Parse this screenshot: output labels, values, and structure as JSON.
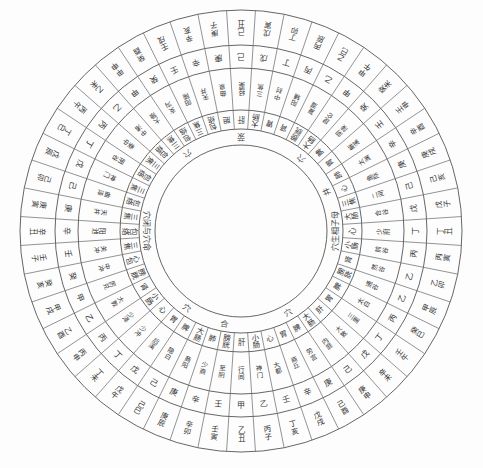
{
  "diagram": {
    "center": {
      "x": 241,
      "y": 231
    },
    "radii": {
      "outer": 221,
      "r1": 186,
      "r2": 163,
      "r3": 121,
      "inner": 86
    },
    "line_color": "#555555",
    "inner_labels": [
      {
        "text": "穴闭与穴命",
        "angle": 270
      },
      {
        "text": "穴生相子母",
        "angle": 90
      },
      {
        "text": "穴",
        "angle": 215
      },
      {
        "text": "荥",
        "angle": 180
      },
      {
        "text": "穴",
        "angle": 140
      },
      {
        "text": "井",
        "angle": 115
      },
      {
        "text": "合",
        "angle": 350
      },
      {
        "text": "穴",
        "angle": 325
      },
      {
        "text": "穴",
        "angle": 30
      }
    ],
    "outer_ring_ganzhi": [
      "乙丑",
      "壬寅",
      "辛卯",
      "庚辰",
      "己巳",
      "戊午",
      "丁未",
      "丙申",
      "乙酉",
      "甲戌",
      "癸亥",
      "壬子",
      "辛丑",
      "庚寅",
      "己卯",
      "戊辰",
      "丁巳",
      "丙午",
      "乙未",
      "甲申",
      "癸酉",
      "壬戌",
      "辛亥",
      "庚子",
      "己丑",
      "戊寅",
      "丁卯",
      "丙辰",
      "乙巳",
      "甲午",
      "癸未",
      "壬申",
      "辛酉",
      "庚戌",
      "己亥",
      "戊子",
      "丁丑",
      "丙寅",
      "乙卯",
      "甲辰",
      "癸巳",
      "壬午",
      "辛未",
      "庚申",
      "己酉",
      "戊戌",
      "丁亥",
      "丙子"
    ],
    "stem_ring": [
      "甲",
      "壬",
      "辛",
      "庚",
      "己",
      "戊",
      "丁",
      "丙",
      "乙",
      "甲",
      "癸",
      "壬",
      "辛",
      "庚",
      "己",
      "戊",
      "丁",
      "丙",
      "乙",
      "甲",
      "癸",
      "壬",
      "辛",
      "庚",
      "己",
      "戊",
      "丁",
      "丙",
      "乙",
      "甲",
      "癸",
      "壬",
      "辛",
      "庚",
      "己",
      "戊",
      "丁",
      "丙",
      "乙",
      "乙",
      "丙",
      "丁",
      "戊",
      "己",
      "庚",
      "辛",
      "壬",
      "乙"
    ],
    "point_ring": [
      "行间",
      "至阴",
      "少商",
      "商阳",
      "隐白",
      "后溪",
      "少冲",
      "少泽",
      "大敦",
      "厉兑",
      "中冲",
      "关冲",
      "阳池",
      "天井",
      "曲泽",
      "神门",
      "阴谷",
      "委中",
      "中渚",
      "大陵",
      "支沟",
      "阳陵",
      "天井",
      "曲泉",
      "经渠",
      "三焦",
      "中封",
      "阳辅",
      "复溜",
      "昆仑",
      "阴陵",
      "解溪",
      "太渊",
      "鱼际",
      "二间",
      "合谷",
      "少府",
      "前谷",
      "然谷",
      "通谷",
      "太白",
      "三里",
      "大敦",
      "内庭",
      "劳宫",
      "商丘",
      "大都",
      "神门"
    ],
    "organ_ring": [
      "肝",
      "膀胱",
      "肺",
      "大肠",
      "脾",
      "胃",
      "心",
      "小肠",
      "肾",
      "膀胱",
      "心包",
      "三焦",
      "包络",
      "三焦",
      "包络",
      "三焦",
      "包络",
      "三焦",
      "包络",
      "三焦",
      "包络",
      "三焦",
      "包络",
      "胆",
      "肝",
      "大肠",
      "胃",
      "肾",
      "膀胱",
      "大肠",
      "脾",
      "胃",
      "肺",
      "心",
      "三焦",
      "大肠",
      "心",
      "小肠",
      "肾",
      "膀胱",
      "脾",
      "胃",
      "肝",
      "大肠",
      "脾",
      "胃",
      "心",
      "小肠"
    ]
  }
}
